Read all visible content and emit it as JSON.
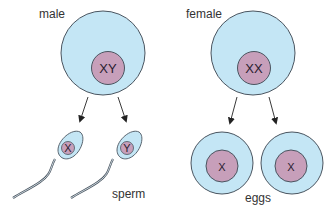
{
  "labels": {
    "male": "male",
    "female": "female",
    "sperm": "sperm",
    "eggs": "eggs"
  },
  "male_cell": {
    "chromosomes": "XY"
  },
  "female_cell": {
    "chromosomes": "XX"
  },
  "sperm": [
    {
      "chromosome": "X"
    },
    {
      "chromosome": "Y"
    }
  ],
  "eggs": [
    {
      "chromosome": "X"
    },
    {
      "chromosome": "X"
    }
  ],
  "colors": {
    "cytoplasm": "#c4e6f5",
    "nucleus": "#c79fba",
    "outline": "#4a5560",
    "text": "#333333"
  }
}
